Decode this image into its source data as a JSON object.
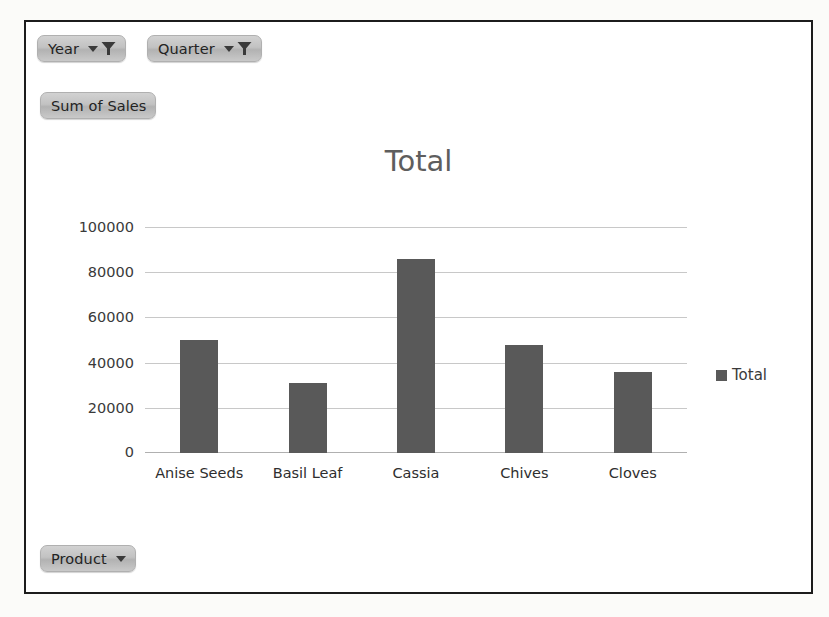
{
  "chart_frame": {
    "border_color": "#1c1c1c",
    "background": "#ffffff"
  },
  "field_buttons": {
    "year": {
      "label": "Year",
      "icon": "filter-funnel-icon",
      "dropdown_icon": "caret-down-icon"
    },
    "quarter": {
      "label": "Quarter",
      "icon": "filter-funnel-icon",
      "dropdown_icon": "caret-down-icon"
    },
    "values": {
      "label": "Sum of Sales"
    },
    "product": {
      "label": "Product",
      "dropdown_icon": "caret-down-icon"
    }
  },
  "legend": {
    "position": "right",
    "entries": [
      {
        "label": "Total",
        "color": "#595959"
      }
    ]
  },
  "chart_data": {
    "type": "bar",
    "title": "Total",
    "xlabel": "",
    "ylabel": "",
    "categories": [
      "Anise Seeds",
      "Basil Leaf",
      "Cassia",
      "Chives",
      "Cloves"
    ],
    "series": [
      {
        "name": "Total",
        "color": "#595959",
        "values": [
          50000,
          31000,
          86000,
          48000,
          36000
        ]
      }
    ],
    "values": [
      50000,
      31000,
      86000,
      48000,
      36000
    ],
    "ylim": [
      0,
      100000
    ],
    "ytick_labels": [
      "100000",
      "80000",
      "60000",
      "40000",
      "20000",
      "0"
    ],
    "ytick_values": [
      100000,
      80000,
      60000,
      40000,
      20000,
      0
    ],
    "grid": true,
    "legend_position": "right"
  }
}
